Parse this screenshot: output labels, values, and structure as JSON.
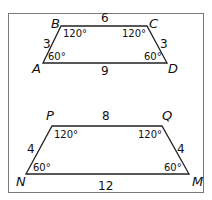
{
  "frame": {
    "border_color": "#7a7a7a"
  },
  "trapezoid_1": {
    "vertices": {
      "A": "A",
      "B": "B",
      "C": "C",
      "D": "D"
    },
    "sides": {
      "BC": "6",
      "AD": "9",
      "AB": "3",
      "CD": "3"
    },
    "angles": {
      "A": "60°",
      "B": "120°",
      "C": "120°",
      "D": "60°"
    }
  },
  "trapezoid_2": {
    "vertices": {
      "P": "P",
      "Q": "Q",
      "N": "N",
      "M": "M"
    },
    "sides": {
      "PQ": "8",
      "NM": "12",
      "NP": "4",
      "QM": "4"
    },
    "angles": {
      "N": "60°",
      "P": "120°",
      "Q": "120°",
      "M": "60°"
    }
  }
}
